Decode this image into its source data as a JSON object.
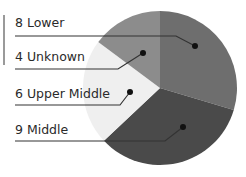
{
  "chart_data": {
    "type": "pie",
    "title": "",
    "start_angle_deg": 0,
    "direction": "clockwise",
    "slices": [
      {
        "label": "Lower",
        "value": 8,
        "display": "8 Lower",
        "color": "#6e6e6e"
      },
      {
        "label": "Middle",
        "value": 9,
        "display": "9 Middle",
        "color": "#4a4a4a"
      },
      {
        "label": "Upper Middle",
        "value": 6,
        "display": "6 Upper Middle",
        "color": "#efefef"
      },
      {
        "label": "Unknown",
        "value": 4,
        "display": "4 Unknown",
        "color": "#8c8c8c"
      }
    ],
    "legend_order": [
      "Lower",
      "Unknown",
      "Upper Middle",
      "Middle"
    ]
  },
  "labels": {
    "lower": "8 Lower",
    "unknown": "4 Unknown",
    "upper_middle": "6 Upper Middle",
    "middle": "9 Middle"
  }
}
